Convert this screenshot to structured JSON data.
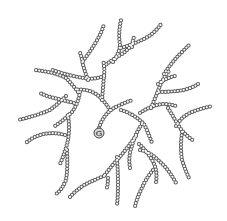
{
  "diagram": {
    "core": {
      "label": "G",
      "x": 99,
      "y": 133,
      "r": 5
    },
    "colors": {
      "bead_stroke": "#5a5a5a",
      "bead_fill": "#ffffff",
      "core_fill": "#d6d6d6"
    },
    "chains": [
      "M99 128 Q104 112 118 106 Q126 102 133 100",
      "M110 110 Q104 100 96 94 Q86 88 75 90",
      "M102 100 Q103 88 104 76 Q105 68 103 60",
      "M104 76 Q94 80 84 78 Q70 76 52 70",
      "M88 80 Q84 70 82 60 Q80 50 79 53",
      "M83 61 Q90 52 96 42 Q102 32 104 24",
      "M104 66 Q112 60 122 54 Q128 50 133 43",
      "M113 62 Q120 52 120 44 Q118 34 121 20",
      "M121 48 Q134 44 146 38 Q156 32 161 24",
      "M132 47 Q132 42 134 37",
      "M78 92 Q72 84 66 78 Q55 72 34 70",
      "M74 103 Q62 100 54 98 Q46 96 40 93",
      "M66 96 Q58 104 50 110 Q36 116 18 120",
      "M80 92 Q78 104 72 112 Q64 120 55 126",
      "M68 115 Q70 128 68 140 Q66 150 60 164",
      "M65 135 Q54 132 44 134 Q34 136 26 143",
      "M67 150 Q68 168 66 180 Q62 190 56 194",
      "M121 110 Q134 114 144 124 Q148 132 152 143",
      "M142 124 Q135 134 132 146 Q128 156 130 168",
      "M136 136 Q126 150 117 160 Q110 168 104 176",
      "M117 157 Q118 172 118 186 Q118 196 117 205",
      "M104 176 Q94 180 86 184 Q76 190 70 197",
      "M108 178 Q108 186 106 190",
      "M139 144 Q146 150 152 160 Q158 170 156 182",
      "M140 150 Q150 152 158 160 Q168 168 176 183",
      "M153 170 Q145 180 141 190 Q136 200 135 207",
      "M140 113 Q150 106 162 104 Q170 104 176 106",
      "M151 108 Q156 96 160 86 Q164 76 170 70",
      "M158 84 Q166 78 175 76",
      "M164 74 Q172 62 180 54 Q186 48 190 44",
      "M159 92 Q172 92 184 90 Q192 88 198 84",
      "M168 108 Q174 118 180 128 Q186 136 194 141",
      "M176 126 Q182 116 192 112 Q202 108 213 106",
      "M182 132 Q180 148 182 160 Q186 172 189 178"
    ]
  }
}
